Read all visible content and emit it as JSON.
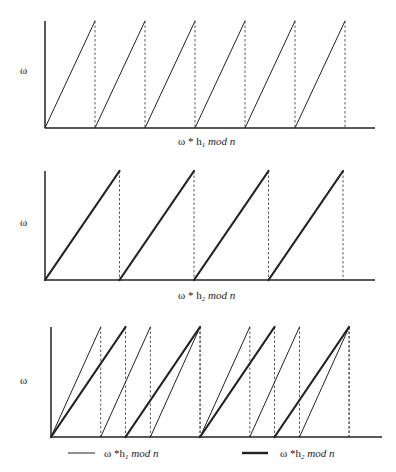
{
  "chart_data": [
    {
      "type": "line",
      "title": "",
      "ylabel": "ω",
      "xlabel": {
        "prefix": "ω * h",
        "sub": "1",
        "suffix": " mod n"
      },
      "x_range": [
        0,
        330
      ],
      "y_range": [
        0,
        1
      ],
      "grid": false,
      "series": [
        {
          "name": "ω * h1 mod n",
          "style": "thin",
          "period": 50,
          "teeth": 6
        }
      ]
    },
    {
      "type": "line",
      "title": "",
      "ylabel": "ω",
      "xlabel": {
        "prefix": "ω * h",
        "sub": "2",
        "suffix": " mod n"
      },
      "x_range": [
        0,
        330
      ],
      "y_range": [
        0,
        1
      ],
      "grid": false,
      "series": [
        {
          "name": "ω * h2 mod n",
          "style": "thick",
          "period": 74.5,
          "teeth": 4
        }
      ]
    },
    {
      "type": "line",
      "title": "",
      "ylabel": "ω",
      "xlabel": null,
      "x_range": [
        0,
        330
      ],
      "y_range": [
        0,
        1
      ],
      "grid": false,
      "legend": "bottom",
      "series": [
        {
          "name": "ω * h1 mod n",
          "style": "thin",
          "period": 49.7,
          "teeth": 6
        },
        {
          "name": "ω * h2 mod n",
          "style": "thick",
          "period": 74.5,
          "teeth": 4
        }
      ]
    }
  ],
  "legend": [
    {
      "prefix": "ω *h",
      "sub": "1",
      "suffix": " mod n",
      "style": "thin"
    },
    {
      "prefix": "ω *h",
      "sub": "2",
      "suffix": " mod n",
      "style": "thick"
    }
  ]
}
